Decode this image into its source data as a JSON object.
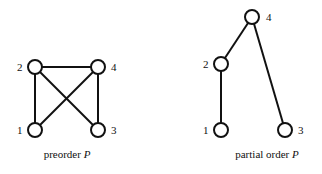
{
  "diagrams": [
    {
      "caption": {
        "text": "preorder ",
        "symbol": "P"
      },
      "nodes": [
        {
          "id": "1",
          "label": "1",
          "x": 35,
          "y": 130
        },
        {
          "id": "2",
          "label": "2",
          "x": 35,
          "y": 67
        },
        {
          "id": "3",
          "label": "3",
          "x": 98,
          "y": 130
        },
        {
          "id": "4",
          "label": "4",
          "x": 98,
          "y": 67
        }
      ],
      "edges": [
        [
          "2",
          "4"
        ],
        [
          "2",
          "1"
        ],
        [
          "2",
          "3"
        ],
        [
          "4",
          "1"
        ],
        [
          "4",
          "3"
        ]
      ]
    },
    {
      "caption": {
        "text": "partial order ",
        "symbol": "P"
      },
      "nodes": [
        {
          "id": "1",
          "label": "1",
          "x": 221,
          "y": 130
        },
        {
          "id": "2",
          "label": "2",
          "x": 221,
          "y": 64
        },
        {
          "id": "3",
          "label": "3",
          "x": 285,
          "y": 130
        },
        {
          "id": "4",
          "label": "4",
          "x": 252,
          "y": 17
        }
      ],
      "edges": [
        [
          "4",
          "2"
        ],
        [
          "2",
          "1"
        ],
        [
          "4",
          "3"
        ]
      ]
    }
  ]
}
